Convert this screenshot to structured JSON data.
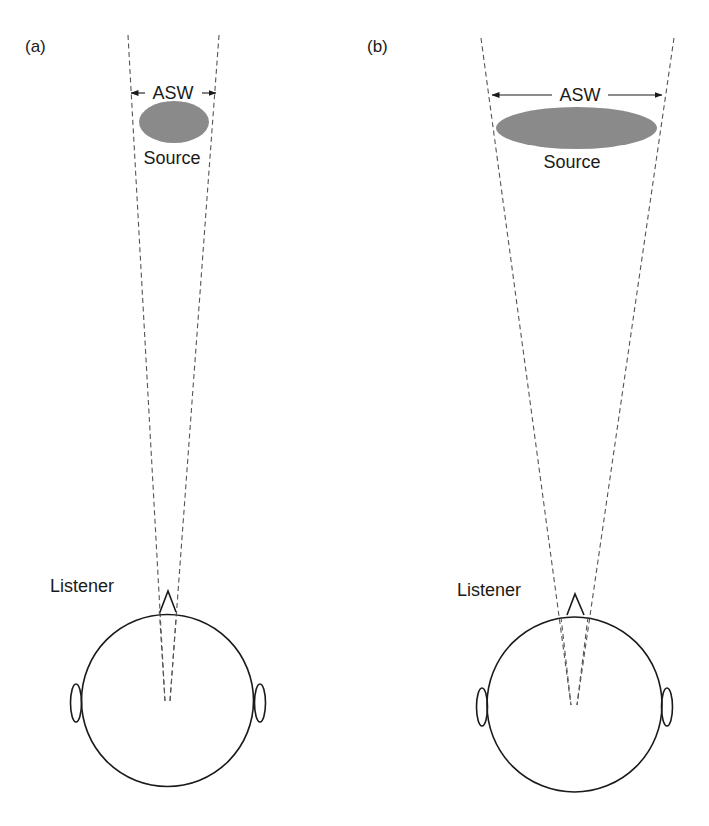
{
  "figure": {
    "panels": [
      {
        "id": "a",
        "label": "(a)",
        "width_label": "ASW",
        "source_label": "Source",
        "listener_label": "Listener",
        "source_width": "narrow"
      },
      {
        "id": "b",
        "label": "(b)",
        "width_label": "ASW",
        "source_label": "Source",
        "listener_label": "Listener",
        "source_width": "wide"
      }
    ],
    "colors": {
      "source_fill": "#8a8a8a",
      "line": "#1a1a1a",
      "dashed_line": "#555555",
      "background": "#ffffff"
    }
  }
}
